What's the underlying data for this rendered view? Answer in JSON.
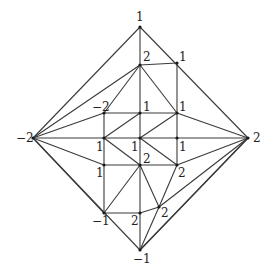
{
  "diagram": {
    "colors": {
      "line": "#3a3a3a",
      "node": "#1a1a1a",
      "label": "#222222",
      "background": "#ffffff"
    },
    "nodes": [
      {
        "id": "top",
        "x": 140,
        "y": 27,
        "label": "1",
        "lx": 136,
        "ly": 21
      },
      {
        "id": "left",
        "x": 33,
        "y": 138,
        "label": "-2",
        "lx": 16,
        "ly": 142
      },
      {
        "id": "right",
        "x": 248,
        "y": 138,
        "label": "2",
        "lx": 253,
        "ly": 142
      },
      {
        "id": "bottom",
        "x": 140,
        "y": 250,
        "label": "-1",
        "lx": 133,
        "ly": 263
      },
      {
        "id": "n2top",
        "x": 140,
        "y": 65,
        "label": "2",
        "lx": 143,
        "ly": 61
      },
      {
        "id": "n1tr",
        "x": 177,
        "y": 63,
        "label": "1",
        "lx": 179,
        "ly": 61
      },
      {
        "id": "nm2",
        "x": 104,
        "y": 113,
        "label": "-2",
        "lx": 92,
        "ly": 111
      },
      {
        "id": "n1c",
        "x": 140,
        "y": 113,
        "label": "1",
        "lx": 143,
        "ly": 111
      },
      {
        "id": "n1r",
        "x": 177,
        "y": 113,
        "label": "1",
        "lx": 179,
        "ly": 111
      },
      {
        "id": "n1l",
        "x": 104,
        "y": 138,
        "label": "1",
        "lx": 96,
        "ly": 151
      },
      {
        "id": "nc",
        "x": 140,
        "y": 138,
        "label": "1",
        "lx": 131,
        "ly": 151
      },
      {
        "id": "n1rr",
        "x": 177,
        "y": 138,
        "label": "1",
        "lx": 179,
        "ly": 151
      },
      {
        "id": "n1ll",
        "x": 104,
        "y": 165,
        "label": "1",
        "lx": 96,
        "ly": 177
      },
      {
        "id": "n2c",
        "x": 140,
        "y": 165,
        "label": "2",
        "lx": 143,
        "ly": 163
      },
      {
        "id": "n2r",
        "x": 177,
        "y": 165,
        "label": "2",
        "lx": 178,
        "ly": 177
      },
      {
        "id": "nm1",
        "x": 104,
        "y": 213,
        "label": "-1",
        "lx": 92,
        "ly": 225
      },
      {
        "id": "n2b",
        "x": 140,
        "y": 213,
        "label": "2",
        "lx": 131,
        "ly": 225
      },
      {
        "id": "n2br",
        "x": 159,
        "y": 207,
        "label": "2",
        "lx": 161,
        "ly": 217
      }
    ],
    "edges": [
      [
        "top",
        "left"
      ],
      [
        "top",
        "right"
      ],
      [
        "left",
        "bottom"
      ],
      [
        "right",
        "bottom"
      ],
      [
        "top",
        "n2top"
      ],
      [
        "n2top",
        "n1tr"
      ],
      [
        "n1tr",
        "n1r"
      ],
      [
        "left",
        "n2top"
      ],
      [
        "n2top",
        "nm2"
      ],
      [
        "n2top",
        "n1c"
      ],
      [
        "n2top",
        "n1r"
      ],
      [
        "left",
        "nm2"
      ],
      [
        "nm2",
        "n1c"
      ],
      [
        "n1c",
        "n1r"
      ],
      [
        "n1r",
        "right"
      ],
      [
        "nm2",
        "n1l"
      ],
      [
        "left",
        "n1l"
      ],
      [
        "n1l",
        "nc"
      ],
      [
        "nc",
        "n1rr"
      ],
      [
        "n1rr",
        "right"
      ],
      [
        "n1l",
        "n1c"
      ],
      [
        "nc",
        "n1r"
      ],
      [
        "n1c",
        "nc"
      ],
      [
        "n1r",
        "n1rr"
      ],
      [
        "n1l",
        "n2c"
      ],
      [
        "nc",
        "n2r"
      ],
      [
        "nc",
        "n2c"
      ],
      [
        "n1rr",
        "n2r"
      ],
      [
        "left",
        "n1ll"
      ],
      [
        "n1l",
        "n1ll"
      ],
      [
        "n1ll",
        "n2c"
      ],
      [
        "n2c",
        "n2r"
      ],
      [
        "n2r",
        "right"
      ],
      [
        "n1ll",
        "nm1"
      ],
      [
        "nm1",
        "n2c"
      ],
      [
        "n2c",
        "n2b"
      ],
      [
        "n2c",
        "n2br"
      ],
      [
        "n2r",
        "n2br"
      ],
      [
        "left",
        "nm1"
      ],
      [
        "nm1",
        "n2b"
      ],
      [
        "n2b",
        "n2br"
      ],
      [
        "n2b",
        "bottom"
      ],
      [
        "n2br",
        "bottom"
      ],
      [
        "n2br",
        "right"
      ],
      [
        "right",
        "bottom"
      ]
    ]
  }
}
